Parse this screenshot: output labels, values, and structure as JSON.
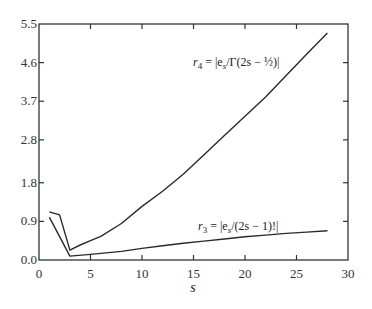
{
  "chart_data": {
    "type": "line",
    "title": "",
    "xlabel": "s",
    "ylabel": "",
    "xlim": [
      0,
      30
    ],
    "ylim": [
      0.0,
      5.5
    ],
    "grid": false,
    "legend": "none (inline annotations)",
    "x_ticks": [
      0,
      5,
      10,
      15,
      20,
      25,
      30
    ],
    "x_tick_labels": [
      "0",
      "5",
      "10",
      "15",
      "20",
      "25",
      "30"
    ],
    "y_ticks": [
      0.0,
      0.9,
      1.8,
      2.8,
      3.7,
      4.6,
      5.5
    ],
    "y_tick_labels": [
      "0.0",
      "0.9",
      "1.8",
      "2.8",
      "3.7",
      "4.6",
      "5.5"
    ],
    "series": [
      {
        "name": "r4",
        "label": "r₄ = |eₛ/Γ(2s − ½)|",
        "x": [
          1,
          2,
          3,
          4,
          5,
          6,
          8,
          10,
          12,
          14,
          16,
          18,
          20,
          22,
          24,
          26,
          28
        ],
        "values": [
          1.12,
          1.05,
          0.23,
          0.35,
          0.45,
          0.55,
          0.85,
          1.25,
          1.6,
          2.0,
          2.45,
          2.9,
          3.35,
          3.8,
          4.3,
          4.8,
          5.29
        ]
      },
      {
        "name": "r3",
        "label": "r₃ = |eₛ/(2s − 1)!|",
        "x": [
          1,
          3,
          5,
          8,
          10,
          12,
          14,
          16,
          18,
          20,
          22,
          24,
          26,
          28
        ],
        "values": [
          1.0,
          0.09,
          0.13,
          0.2,
          0.27,
          0.33,
          0.39,
          0.44,
          0.49,
          0.54,
          0.58,
          0.62,
          0.65,
          0.68
        ]
      }
    ],
    "annotations": [
      {
        "text": "r₄ = |eₛ/Γ(2s − ½)|",
        "series": "r4",
        "position": [
          14,
          4.6
        ]
      },
      {
        "text": "r₃ = |eₛ/(2s − 1)!|",
        "series": "r3",
        "position": [
          15,
          0.9
        ]
      }
    ]
  },
  "labels": {
    "xlabel": "s",
    "r4_name": "r",
    "r4_sub": "4",
    "r4_expr": " =  |e",
    "r4_expr_sub": "s",
    "r4_expr_tail": "/Γ(2s − ½)|",
    "r3_name": "r",
    "r3_sub": "3",
    "r3_expr": " =  |e",
    "r3_expr_sub": "s",
    "r3_expr_tail": "/(2s − 1)!|"
  },
  "colors": {
    "line": "#2a2a2a",
    "axis": "#333333",
    "background": "#ffffff"
  }
}
